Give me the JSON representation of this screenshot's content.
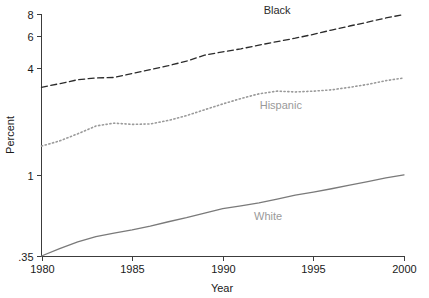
{
  "chart_data": {
    "type": "line",
    "title": "",
    "xlabel": "Year",
    "ylabel": "Percent",
    "yscale": "log",
    "grid": false,
    "legend_position": "inline-annotations",
    "xlim": [
      1980,
      2000
    ],
    "ylim": [
      0.35,
      8
    ],
    "xticks": [
      1980,
      1985,
      1990,
      1995,
      2000
    ],
    "xtick_labels": [
      "1980",
      "1985",
      "1990",
      "1995",
      "2000"
    ],
    "yticks": [
      0.35,
      1,
      4,
      6,
      8
    ],
    "ytick_labels": [
      ".35",
      "1",
      "4",
      "6",
      "8"
    ],
    "x": [
      1980,
      1981,
      1982,
      1983,
      1984,
      1985,
      1986,
      1987,
      1988,
      1989,
      1990,
      1991,
      1992,
      1993,
      1994,
      1995,
      1996,
      1997,
      1998,
      1999,
      2000
    ],
    "series": [
      {
        "name": "Black",
        "style": "dashed",
        "color": "#2b2b2b",
        "label": "Black",
        "values": [
          3.1,
          3.25,
          3.42,
          3.5,
          3.52,
          3.7,
          3.9,
          4.1,
          4.35,
          4.7,
          4.9,
          5.1,
          5.35,
          5.6,
          5.85,
          6.15,
          6.5,
          6.85,
          7.2,
          7.6,
          7.95
        ]
      },
      {
        "name": "Hispanic",
        "style": "dotted",
        "color": "#9a9a9a",
        "label": "Hispanic",
        "values": [
          1.45,
          1.55,
          1.7,
          1.88,
          1.95,
          1.92,
          1.93,
          2.02,
          2.15,
          2.32,
          2.5,
          2.68,
          2.85,
          2.95,
          2.92,
          2.95,
          3.0,
          3.1,
          3.22,
          3.38,
          3.5
        ]
      },
      {
        "name": "White",
        "style": "solid",
        "color": "#7a7a7a",
        "label": "White",
        "values": [
          0.35,
          0.385,
          0.42,
          0.45,
          0.47,
          0.49,
          0.515,
          0.545,
          0.575,
          0.61,
          0.645,
          0.67,
          0.695,
          0.73,
          0.77,
          0.8,
          0.835,
          0.875,
          0.915,
          0.96,
          1.0
        ]
      }
    ],
    "annotations": [
      {
        "text": "Black",
        "x": 1993.0,
        "y": 8.0,
        "color": "#2b2b2b"
      },
      {
        "text": "Hispanic",
        "x": 1993.2,
        "y": 2.35,
        "color": "#9a9a9a"
      },
      {
        "text": "White",
        "x": 1992.5,
        "y": 0.56,
        "color": "#9a9a9a"
      }
    ]
  }
}
